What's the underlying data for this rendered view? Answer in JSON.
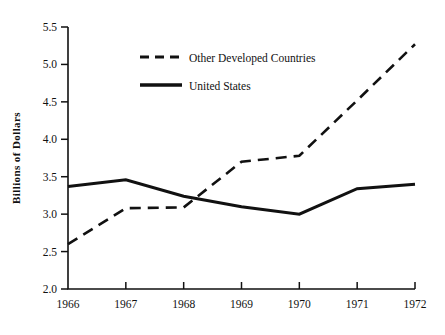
{
  "chart_data": {
    "type": "line",
    "title": "",
    "xlabel": "",
    "ylabel": "Billions of Dollars",
    "categories": [
      "1966",
      "1967",
      "1968",
      "1969",
      "1970",
      "1971",
      "1972"
    ],
    "x": [
      1966,
      1967,
      1968,
      1969,
      1970,
      1971,
      1972
    ],
    "xlim": [
      1966,
      1972
    ],
    "ylim": [
      2.0,
      5.5
    ],
    "ytick_labels": [
      "2.0",
      "2.5",
      "3.0",
      "3.5",
      "4.0",
      "4.5",
      "5.0",
      "5.5"
    ],
    "yticks": [
      2.0,
      2.5,
      3.0,
      3.5,
      4.0,
      4.5,
      5.0,
      5.5
    ],
    "grid": false,
    "legend_position": "upper-center-left",
    "series": [
      {
        "name": "Other Developed Countries",
        "style": "dashed",
        "color": "#111111",
        "values": [
          2.6,
          3.08,
          3.09,
          3.7,
          3.78,
          4.52,
          5.27
        ]
      },
      {
        "name": "United States",
        "style": "solid",
        "color": "#111111",
        "values": [
          3.37,
          3.46,
          3.24,
          3.1,
          3.0,
          3.34,
          3.4
        ]
      }
    ]
  },
  "legend": {
    "entries": [
      {
        "label": "Other Developed Countries",
        "style": "dashed"
      },
      {
        "label": "United States",
        "style": "solid"
      }
    ]
  }
}
